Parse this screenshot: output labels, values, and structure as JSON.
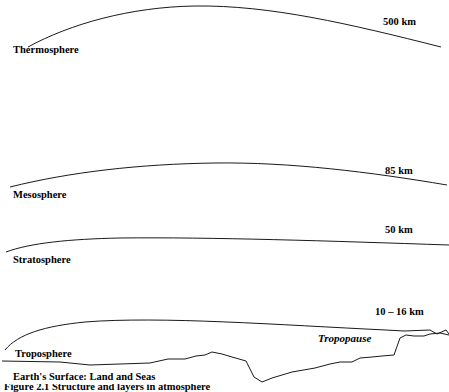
{
  "figure": {
    "type": "atmosphere-cross-section",
    "background_color": "#ffffff",
    "line_color": "#1a1a1a",
    "text_color": "#000000"
  },
  "layers": [
    {
      "id": "thermosphere",
      "name": "Thermosphere",
      "altitude_label": "500 km",
      "altitude_km": 500
    },
    {
      "id": "mesosphere",
      "name": "Mesosphere",
      "altitude_label": "85 km",
      "altitude_km": 85
    },
    {
      "id": "stratosphere",
      "name": "Stratosphere",
      "altitude_label": "50 km",
      "altitude_km": 50
    },
    {
      "id": "troposphere",
      "name": "Troposphere",
      "altitude_label": "10 – 16 km",
      "altitude_km_range": [
        10,
        16
      ]
    }
  ],
  "boundaries": {
    "tropopause_label": "Tropopause"
  },
  "surface": {
    "label": "Earth's Surface: Land and Seas"
  },
  "caption": {
    "text": "Figure 2.1   Structure and layers in atmosphere",
    "clipped": true
  }
}
